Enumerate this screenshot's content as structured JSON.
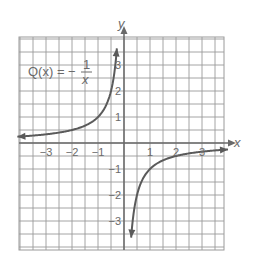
{
  "chart_data": {
    "type": "line",
    "function_label": {
      "lhs": "Q(x) = −",
      "numerator": "1",
      "denominator": "x"
    },
    "xlabel": "x",
    "ylabel": "y",
    "xlim": [
      -4,
      4
    ],
    "ylim": [
      -4,
      4
    ],
    "grid": true,
    "grid_step": 0.5,
    "x_ticks": [
      {
        "value": -3,
        "label": "−3"
      },
      {
        "value": -2,
        "label": "−2"
      },
      {
        "value": -1,
        "label": "−1"
      },
      {
        "value": 1,
        "label": "1"
      },
      {
        "value": 2,
        "label": "2"
      },
      {
        "value": 3,
        "label": "3"
      }
    ],
    "y_ticks": [
      {
        "value": 3,
        "label": "3"
      },
      {
        "value": 2,
        "label": "2"
      },
      {
        "value": 1,
        "label": "1"
      },
      {
        "value": -1,
        "label": "−1"
      },
      {
        "value": -2,
        "label": "−2"
      },
      {
        "value": -3,
        "label": "−3"
      }
    ],
    "series": [
      {
        "name": "Q(x) = -1/x, x < 0",
        "points": [
          [
            -4,
            0.25
          ],
          [
            -3,
            0.333
          ],
          [
            -2,
            0.5
          ],
          [
            -1,
            1
          ],
          [
            -0.5,
            2
          ],
          [
            -0.33,
            3
          ],
          [
            -0.27,
            3.7
          ]
        ]
      },
      {
        "name": "Q(x) = -1/x, x > 0",
        "points": [
          [
            0.27,
            -3.7
          ],
          [
            0.33,
            -3
          ],
          [
            0.5,
            -2
          ],
          [
            1,
            -1
          ],
          [
            2,
            -0.5
          ],
          [
            3,
            -0.333
          ],
          [
            3.9,
            -0.256
          ]
        ]
      }
    ],
    "colors": {
      "grid": "#9a9a9a",
      "axis": "#6a6a6a",
      "curve": "#5a5a5a",
      "text": "#6a6a6a"
    }
  }
}
